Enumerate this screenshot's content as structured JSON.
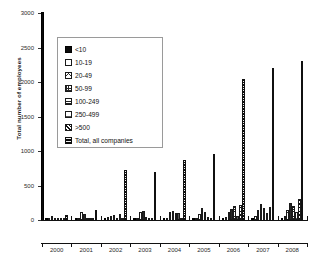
{
  "chart_data": {
    "type": "bar",
    "title": "",
    "xlabel": "",
    "ylabel": "Total number of employees",
    "ylim": [
      0,
      3000
    ],
    "yticks": [
      0,
      500,
      1000,
      1500,
      2000,
      2500,
      3000
    ],
    "grid": false,
    "legend_position": "upper-left-inside",
    "categories": [
      "2000",
      "2001",
      "2002",
      "2003",
      "2004",
      "2005",
      "2006",
      "2007",
      "2008"
    ],
    "series": [
      {
        "name": "<10",
        "pattern": "solid",
        "values": [
          8,
          10,
          12,
          14,
          16,
          18,
          22,
          26,
          30
        ]
      },
      {
        "name": "10-19",
        "pattern": "white",
        "values": [
          12,
          15,
          40,
          20,
          22,
          30,
          40,
          55,
          60
        ]
      },
      {
        "name": "20-49",
        "pattern": "crosshatch",
        "values": [
          55,
          115,
          60,
          110,
          120,
          90,
          120,
          140,
          150
        ]
      },
      {
        "name": "50-99",
        "pattern": "grid",
        "values": [
          30,
          90,
          75,
          130,
          130,
          180,
          160,
          230,
          250
        ]
      },
      {
        "name": "100-249",
        "pattern": "hlines",
        "values": [
          18,
          12,
          30,
          40,
          105,
          110,
          200,
          170,
          210
        ]
      },
      {
        "name": "250-499",
        "pattern": "lightgrid",
        "values": [
          5,
          8,
          90,
          25,
          95,
          45,
          60,
          100,
          120
        ]
      },
      {
        "name": ">500",
        "pattern": "diag",
        "values": [
          0,
          0,
          0,
          0,
          0,
          0,
          220,
          190,
          310
        ]
      },
      {
        "name": "Total, all companies",
        "pattern": "dense",
        "values": [
          75,
          140,
          730,
          700,
          870,
          960,
          2040,
          2200,
          2300
        ]
      }
    ]
  },
  "legend": {
    "items": [
      {
        "label": "<10"
      },
      {
        "label": "10-19"
      },
      {
        "label": "20-49"
      },
      {
        "label": "50-99"
      },
      {
        "label": "100-249"
      },
      {
        "label": "250-499"
      },
      {
        "label": ">500"
      },
      {
        "label": "Total, all companies"
      }
    ]
  },
  "axes": {
    "y_title": "Total number of employees",
    "y_labels": [
      "3000",
      "2500",
      "2000",
      "1500",
      "1000",
      "500",
      "0"
    ],
    "x_labels": [
      "2000",
      "2001",
      "2002",
      "2003",
      "2004",
      "2005",
      "2006",
      "2007",
      "2008"
    ]
  }
}
